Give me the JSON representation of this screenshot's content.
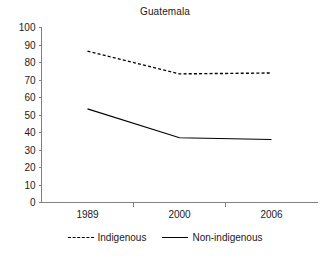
{
  "chart_data": {
    "type": "line",
    "title": "Guatemala",
    "xlabel": "",
    "ylabel": "",
    "categories": [
      "1989",
      "2000",
      "2006"
    ],
    "series": [
      {
        "name": "Indigenous",
        "values": [
          86.5,
          73.5,
          74.0
        ],
        "style": "dashed"
      },
      {
        "name": "Non-indigenous",
        "values": [
          53.5,
          37.0,
          36.0
        ],
        "style": "solid"
      }
    ],
    "ylim": [
      0,
      100
    ],
    "ytick_step": 10,
    "yticks": [
      0,
      10,
      20,
      30,
      40,
      50,
      60,
      70,
      80,
      90,
      100
    ],
    "ytick_labels": [
      "0",
      "10",
      "20",
      "30",
      "40",
      "50",
      "60",
      "70",
      "80",
      "90",
      "100"
    ],
    "grid": false,
    "legend_position": "bottom",
    "colors": {
      "series": "#000000",
      "axis": "#808080",
      "text": "#1a1a1a"
    }
  },
  "legend": {
    "entries": [
      {
        "label": "Indigenous"
      },
      {
        "label": "Non-indigenous"
      }
    ]
  }
}
